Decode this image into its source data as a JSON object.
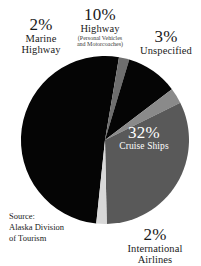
{
  "chart_data": {
    "type": "pie",
    "title": "",
    "subtitle": "",
    "xlabel": "",
    "ylabel": "",
    "legend_position": "none",
    "grid": false,
    "units": "percent",
    "source": "Source: Alaska Division of Tourism",
    "categories": [
      "Domestic Air",
      "Marine Highway",
      "Highway",
      "Unspecified",
      "Cruise Ships",
      "International Airlines"
    ],
    "values": [
      51,
      2,
      10,
      3,
      32,
      2
    ],
    "slices": [
      {
        "label": "Domestic Air",
        "value": 51,
        "display_pct": "",
        "color": "#050505",
        "labeled": false
      },
      {
        "label": "Marine Highway",
        "value": 2,
        "display_pct": "2%",
        "color": "#6e6e6e",
        "labeled": true
      },
      {
        "label": "Highway",
        "value": 10,
        "display_pct": "10%",
        "color": "#050505",
        "labeled": true,
        "note": "(Personal Vehicles and Motorcoaches)"
      },
      {
        "label": "Unspecified",
        "value": 3,
        "display_pct": "3%",
        "color": "#8a8a8a",
        "labeled": true
      },
      {
        "label": "Cruise Ships",
        "value": 32,
        "display_pct": "32%",
        "color": "#595959",
        "labeled": true
      },
      {
        "label": "International Airlines",
        "value": 2,
        "display_pct": "2%",
        "color": "#d8d8d8",
        "labeled": true
      }
    ]
  },
  "labels": {
    "marine_highway": {
      "pct": "2%",
      "line1": "Marine",
      "line2": "Highway"
    },
    "highway": {
      "pct": "10%",
      "line1": "Highway",
      "sub1": "(Personal Vehicles",
      "sub2": "and Motorcoaches)"
    },
    "unspecified": {
      "pct": "3%",
      "line1": "Unspecified"
    },
    "cruise_ships": {
      "pct": "32%",
      "line1": "Cruise Ships"
    },
    "international_airlines": {
      "pct": "2%",
      "line1": "International",
      "line2": "Airlines"
    }
  },
  "source": {
    "line1": "Source:",
    "line2": "Alaska Division",
    "line3": "of Tourism"
  },
  "colors": {
    "background": "#ffffff",
    "text": "#1a1a1a",
    "slice_dark": "#050505",
    "slice_mid": "#595959",
    "slice_light_gray": "#8a8a8a",
    "slice_pale": "#d8d8d8",
    "slice_marine": "#6e6e6e",
    "label_on_slice": "#ffffff"
  }
}
